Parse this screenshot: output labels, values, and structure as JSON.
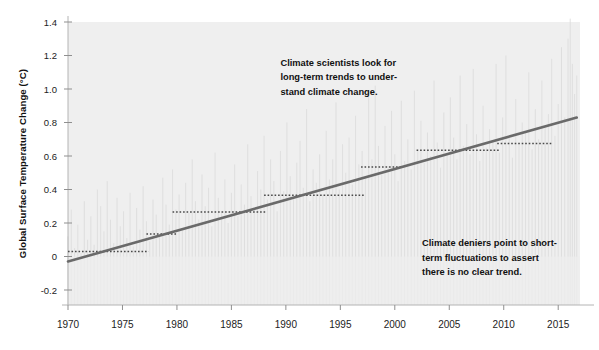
{
  "chart_data": {
    "type": "line",
    "title": "",
    "subtitle": "",
    "xlabel": "",
    "ylabel": "Global Surface Temperature Change (°C)",
    "xlim": [
      1970,
      2017
    ],
    "ylim": [
      -0.32,
      1.45
    ],
    "grid": false,
    "legend": "none",
    "y_ticks": [
      -0.2,
      0,
      0.2,
      0.4,
      0.6,
      0.8,
      1.0,
      1.2,
      1.4
    ],
    "y_tick_labels": [
      "-0.2",
      "0",
      "0.2",
      "0.4",
      "0.6",
      "0.8",
      "1.0",
      "1.2",
      "1.4"
    ],
    "x_ticks": [
      1970,
      1975,
      1980,
      1985,
      1990,
      1995,
      2000,
      2005,
      2010,
      2015
    ],
    "x_tick_labels": [
      "1970",
      "1975",
      "1980",
      "1985",
      "1990",
      "1995",
      "2000",
      "2005",
      "2010",
      "2015"
    ],
    "series": [
      {
        "name": "Monthly temperature anomaly",
        "type": "spikes",
        "color": "#dcdcdc",
        "description": "Light grey vertical monthly anomaly spikes filling the plot area from the x-axis upward",
        "x": [
          1970.0,
          1970.3,
          1970.6,
          1970.9,
          1971.2,
          1971.5,
          1971.8,
          1972.1,
          1972.4,
          1972.7,
          1973.0,
          1973.3,
          1973.6,
          1973.9,
          1974.2,
          1974.5,
          1974.8,
          1975.1,
          1975.4,
          1975.7,
          1976.0,
          1976.3,
          1976.6,
          1976.9,
          1977.2,
          1977.5,
          1977.8,
          1978.1,
          1978.4,
          1978.7,
          1979.0,
          1979.3,
          1979.6,
          1979.9,
          1980.2,
          1980.5,
          1980.8,
          1981.1,
          1981.4,
          1981.7,
          1982.0,
          1982.3,
          1982.6,
          1982.9,
          1983.2,
          1983.5,
          1983.8,
          1984.1,
          1984.4,
          1984.7,
          1985.0,
          1985.3,
          1985.6,
          1985.9,
          1986.2,
          1986.5,
          1986.8,
          1987.1,
          1987.4,
          1987.7,
          1988.0,
          1988.3,
          1988.6,
          1988.9,
          1989.2,
          1989.5,
          1989.8,
          1990.1,
          1990.4,
          1990.7,
          1991.0,
          1991.3,
          1991.6,
          1991.9,
          1992.2,
          1992.5,
          1992.8,
          1993.1,
          1993.4,
          1993.7,
          1994.0,
          1994.3,
          1994.6,
          1994.9,
          1995.2,
          1995.5,
          1995.8,
          1996.1,
          1996.4,
          1996.7,
          1997.0,
          1997.3,
          1997.6,
          1997.9,
          1998.2,
          1998.5,
          1998.8,
          1999.1,
          1999.4,
          1999.7,
          2000.0,
          2000.3,
          2000.6,
          2000.9,
          2001.2,
          2001.5,
          2001.8,
          2002.1,
          2002.4,
          2002.7,
          2003.0,
          2003.3,
          2003.6,
          2003.9,
          2004.2,
          2004.5,
          2004.8,
          2005.1,
          2005.4,
          2005.7,
          2006.0,
          2006.3,
          2006.6,
          2006.9,
          2007.2,
          2007.5,
          2007.8,
          2008.1,
          2008.4,
          2008.7,
          2009.0,
          2009.3,
          2009.6,
          2009.9,
          2010.2,
          2010.5,
          2010.8,
          2011.1,
          2011.4,
          2011.7,
          2012.0,
          2012.3,
          2012.6,
          2012.9,
          2013.2,
          2013.5,
          2013.8,
          2014.1,
          2014.4,
          2014.7,
          2015.0,
          2015.3,
          2015.6,
          2015.9,
          2016.1,
          2016.3,
          2016.5,
          2016.7
        ],
        "values": [
          0.12,
          0.28,
          0.05,
          0.19,
          0.02,
          0.33,
          0.1,
          0.24,
          0.07,
          0.4,
          0.3,
          0.15,
          0.45,
          0.22,
          0.08,
          0.35,
          0.18,
          0.27,
          0.11,
          0.38,
          0.06,
          0.29,
          0.16,
          0.42,
          0.21,
          0.09,
          0.34,
          0.25,
          0.13,
          0.47,
          0.31,
          0.19,
          0.52,
          0.28,
          0.37,
          0.17,
          0.44,
          0.26,
          0.58,
          0.33,
          0.22,
          0.49,
          0.3,
          0.41,
          0.18,
          0.62,
          0.35,
          0.27,
          0.46,
          0.2,
          0.38,
          0.55,
          0.24,
          0.43,
          0.31,
          0.67,
          0.36,
          0.29,
          0.51,
          0.4,
          0.72,
          0.34,
          0.58,
          0.45,
          0.27,
          0.63,
          0.39,
          0.8,
          0.48,
          0.35,
          0.56,
          0.69,
          0.41,
          0.88,
          0.33,
          0.52,
          0.44,
          0.61,
          0.37,
          0.75,
          0.46,
          0.58,
          0.92,
          0.4,
          0.67,
          0.5,
          0.71,
          0.43,
          0.84,
          0.55,
          0.63,
          0.47,
          0.96,
          0.58,
          1.02,
          0.66,
          0.49,
          0.78,
          0.54,
          0.87,
          0.61,
          0.45,
          0.93,
          0.57,
          0.7,
          0.52,
          0.99,
          0.64,
          0.81,
          0.56,
          0.74,
          0.6,
          1.05,
          0.68,
          0.53,
          0.86,
          0.62,
          0.95,
          0.71,
          0.58,
          1.08,
          0.66,
          0.79,
          0.61,
          1.12,
          0.73,
          0.57,
          0.9,
          0.65,
          0.76,
          0.69,
          1.15,
          0.62,
          0.83,
          1.2,
          0.71,
          0.59,
          0.94,
          0.67,
          0.8,
          0.74,
          1.1,
          0.64,
          0.88,
          0.7,
          1.05,
          0.77,
          0.85,
          1.18,
          0.72,
          0.91,
          1.25,
          0.83,
          1.3,
          1.42,
          1.15,
          0.97,
          1.08
        ]
      },
      {
        "name": "Long-term linear trend",
        "type": "line",
        "color": "#6a6a6a",
        "start": {
          "x": 1970,
          "y": -0.03
        },
        "end": {
          "x": 2016.7,
          "y": 0.83
        }
      },
      {
        "name": "Short-term flat segments (hiatus periods)",
        "type": "dotted-steps",
        "color": "#4a4a4a",
        "segments": [
          {
            "x0": 1970.0,
            "x1": 1977.4,
            "y": 0.03
          },
          {
            "x0": 1977.2,
            "x1": 1980.0,
            "y": 0.135
          },
          {
            "x0": 1979.6,
            "x1": 1988.2,
            "y": 0.265
          },
          {
            "x0": 1988.0,
            "x1": 1997.2,
            "y": 0.365
          },
          {
            "x0": 1996.9,
            "x1": 2000.6,
            "y": 0.535
          },
          {
            "x0": 2002.0,
            "x1": 2009.7,
            "y": 0.635
          },
          {
            "x0": 2009.4,
            "x1": 2014.4,
            "y": 0.675
          }
        ]
      }
    ],
    "annotations": [
      {
        "name": "scientists-annotation",
        "lines": [
          "Climate scientists look for",
          "long-term trends to under-",
          "stand climate change."
        ],
        "x": 1989.5,
        "y": 1.14
      },
      {
        "name": "deniers-annotation",
        "lines": [
          "Climate deniers point to short-",
          "term fluctuations to assert",
          "there is no clear trend."
        ],
        "x": 2002.5,
        "y": 0.06
      }
    ],
    "colors": {
      "background": "#ffffff",
      "band": "#efefef",
      "spikes": "#dcdcdc",
      "trend": "#6a6a6a",
      "hiatus": "#4a4a4a",
      "axis": "#b4b4b4",
      "tick": "#8f8f8f",
      "text": "#111111"
    }
  }
}
